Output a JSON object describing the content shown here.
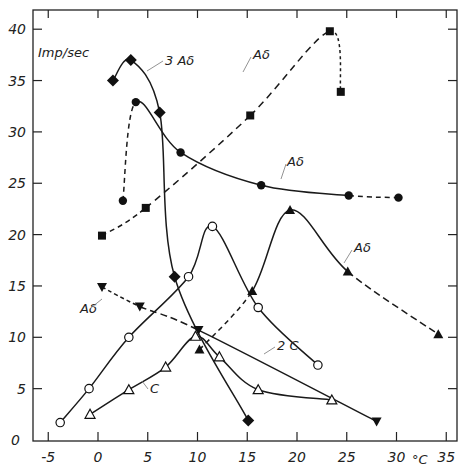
{
  "chart_data": {
    "type": "line",
    "title": "",
    "xlabel": "°C",
    "ylabel": "Imp/sec",
    "xlim": [
      -7,
      36
    ],
    "ylim": [
      0,
      42
    ],
    "grid": false,
    "x_ticks": [
      -5,
      0,
      5,
      10,
      15,
      20,
      25,
      30,
      35
    ],
    "y_ticks": [
      0,
      5,
      10,
      15,
      20,
      25,
      30,
      35,
      40
    ],
    "x_tick_labels": [
      "-5",
      "0",
      "5",
      "10",
      "15",
      "20",
      "25",
      "30",
      "35"
    ],
    "y_tick_labels": [
      "0",
      "5",
      "10",
      "15",
      "20",
      "25",
      "30",
      "35",
      "40"
    ],
    "series": [
      {
        "name": "3 Aδ",
        "marker": "diamond-filled",
        "line": "solid",
        "points": [
          [
            1.5,
            35.0
          ],
          [
            3.3,
            37.0
          ],
          [
            6.2,
            31.9
          ],
          [
            7.7,
            15.9
          ],
          [
            15.1,
            1.9
          ]
        ]
      },
      {
        "name": "Aδ (filled circles)",
        "marker": "circle-filled",
        "line": "mixed",
        "points": [
          [
            2.5,
            23.3
          ],
          [
            3.8,
            32.9
          ],
          [
            8.3,
            28.0
          ],
          [
            16.4,
            24.8
          ],
          [
            25.2,
            23.8
          ],
          [
            30.2,
            23.6
          ]
        ]
      },
      {
        "name": "Aδ (filled squares)",
        "marker": "square-filled",
        "line": "dashed",
        "points": [
          [
            0.4,
            19.9
          ],
          [
            4.8,
            22.6
          ],
          [
            15.3,
            31.6
          ],
          [
            23.3,
            39.8
          ],
          [
            24.4,
            33.9
          ]
        ]
      },
      {
        "name": "2 C",
        "marker": "circle-open",
        "line": "solid",
        "points": [
          [
            -3.8,
            1.7
          ],
          [
            -0.9,
            5.0
          ],
          [
            3.1,
            10.0
          ],
          [
            9.1,
            15.9
          ],
          [
            11.5,
            20.8
          ],
          [
            16.1,
            12.9
          ],
          [
            22.1,
            7.3
          ]
        ]
      },
      {
        "name": "C",
        "marker": "triangle-open",
        "line": "solid",
        "points": [
          [
            -0.8,
            2.5
          ],
          [
            3.1,
            4.9
          ],
          [
            6.8,
            7.1
          ],
          [
            9.8,
            10.1
          ],
          [
            12.2,
            8.1
          ],
          [
            16.1,
            4.9
          ],
          [
            23.5,
            3.9
          ]
        ]
      },
      {
        "name": "Aδ (filled triangles)",
        "marker": "triangle-filled",
        "line": "mixed",
        "points": [
          [
            10.2,
            8.8
          ],
          [
            15.5,
            14.5
          ],
          [
            19.3,
            22.4
          ],
          [
            25.1,
            16.4
          ],
          [
            34.2,
            10.3
          ]
        ]
      },
      {
        "name": "Aδ (filled down-triangles)",
        "marker": "triangle-down-filled",
        "line": "mixed",
        "points": [
          [
            0.4,
            14.9
          ],
          [
            4.2,
            13.0
          ],
          [
            10.1,
            10.7
          ],
          [
            28.0,
            1.8
          ]
        ]
      }
    ],
    "annotations": [
      {
        "text": "Imp/sec",
        "x": -5.5,
        "y": 37.5
      },
      {
        "text": "3 Aδ",
        "x": 6.5,
        "y": 36.3
      },
      {
        "text": "Aδ",
        "x": 16.5,
        "y": 36.5
      },
      {
        "text": "Aδ",
        "x": 21.0,
        "y": 26.5
      },
      {
        "text": "Aδ",
        "x": 27.5,
        "y": 17.5
      },
      {
        "text": "Aδ",
        "x": -2.5,
        "y": 11.5
      },
      {
        "text": "2 C",
        "x": 18.0,
        "y": 11.0
      },
      {
        "text": "C",
        "x": 5.5,
        "y": 4.0
      },
      {
        "text": "°C",
        "x": 32.0,
        "y": -3
      }
    ]
  }
}
